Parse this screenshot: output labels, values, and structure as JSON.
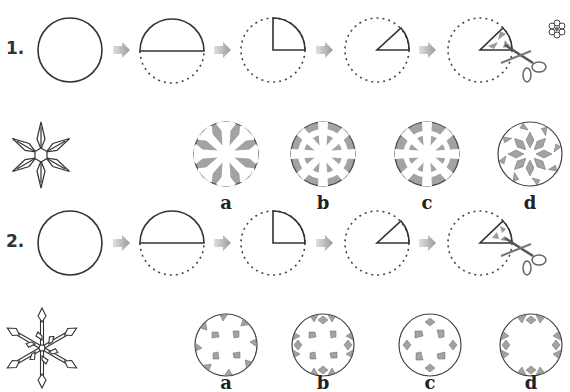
{
  "problems": [
    {
      "number": "1.",
      "steps": [
        "full-circle",
        "half-fold",
        "quarter-fold",
        "sixth-fold",
        "cut-with-scissors"
      ],
      "target_shape": "snowflake-hexagon-center",
      "options": [
        {
          "label": "a",
          "pattern": "snowflake-gray-wedges"
        },
        {
          "label": "b",
          "pattern": "wheel-gray-rim-blocks"
        },
        {
          "label": "c",
          "pattern": "wheel-gray-rim-blocks-alt"
        },
        {
          "label": "d",
          "pattern": "snowflake-gray-outline-white"
        }
      ]
    },
    {
      "number": "2.",
      "steps": [
        "full-circle",
        "half-fold",
        "quarter-fold",
        "sixth-fold",
        "cut-with-scissors"
      ],
      "target_shape": "snowflake-thin-star",
      "options": [
        {
          "label": "a",
          "pattern": "rim-triangles-inner-quads"
        },
        {
          "label": "b",
          "pattern": "rim-triangles-diamonds-inner-quads"
        },
        {
          "label": "c",
          "pattern": "diamonds-inner-quads"
        },
        {
          "label": "d",
          "pattern": "rim-triangles-diamonds"
        }
      ]
    }
  ],
  "decoration": {
    "flower_icon": "flower-icon"
  },
  "colors": {
    "stroke": "#333333",
    "fill_gray": "#a0a0a0",
    "arrow": "#bbbbbb",
    "background": "#ffffff"
  }
}
